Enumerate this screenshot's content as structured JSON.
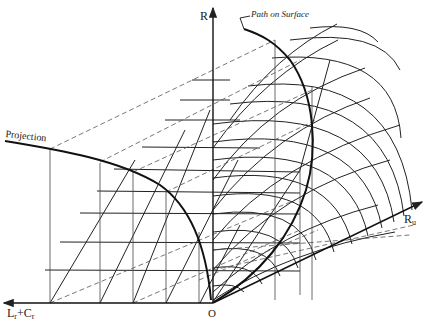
{
  "figure": {
    "labels": {
      "r_axis": "R",
      "path_on_surface": "Path on Surface",
      "projection": "Projection",
      "ru_axis_main": "R",
      "ru_axis_sub": "u",
      "lc_axis_l": "L",
      "lc_axis_l_sub": "r",
      "lc_axis_plus": "+",
      "lc_axis_c": "C",
      "lc_axis_c_sub": "r",
      "origin": "O"
    },
    "colors": {
      "ink": "#222222",
      "background": "#ffffff"
    },
    "geometry": {
      "origin": [
        212,
        303
      ],
      "r_axis_top": [
        213,
        8
      ],
      "ru_axis_end": [
        422,
        202
      ],
      "lc_axis_end": [
        4,
        303
      ]
    }
  }
}
